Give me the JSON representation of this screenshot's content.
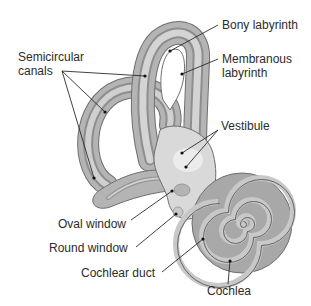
{
  "diagram": {
    "labels": {
      "semicircular_canals": "Semicircular\ncanals",
      "bony_labyrinth": "Bony labyrinth",
      "membranous_labyrinth": "Membranous\nlabyrinth",
      "vestibule": "Vestibule",
      "oval_window": "Oval window",
      "round_window": "Round window",
      "cochlear_duct": "Cochlear duct",
      "cochlea": "Cochlea"
    },
    "colors": {
      "bony": "#b4b4b4",
      "bony_outline": "#6e6e6e",
      "membranous": "#d9d9d9",
      "membranous_dark": "#8e8e8e",
      "vestibule_light": "#ececec",
      "cochlea_dark": "#8a8a8a",
      "cochlea_light": "#c4c4c4",
      "leader_line": "#2b2b2b",
      "text": "#2b2b2b"
    }
  }
}
